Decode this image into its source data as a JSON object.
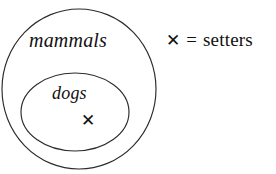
{
  "diagram": {
    "type": "nested-set-venn",
    "background_color": "#ffffff",
    "stroke_color": "#2b2b2b",
    "text_color": "#111111",
    "sets": [
      {
        "id": "outer",
        "label": "mammals",
        "shape": "circle",
        "cx": 79,
        "cy": 89,
        "rx": 77,
        "ry": 80
      },
      {
        "id": "inner",
        "label": "dogs",
        "shape": "ellipse",
        "cx": 75,
        "cy": 112,
        "rx": 54,
        "ry": 39
      }
    ],
    "members": [
      {
        "id": "setter-member",
        "glyph": "✕",
        "inside_set": "inner",
        "x": 89,
        "y": 122
      }
    ]
  },
  "legend": {
    "glyph": "✕",
    "equals": "=",
    "label": "setters"
  }
}
